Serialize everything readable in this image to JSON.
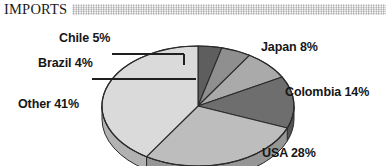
{
  "header": {
    "title": "IMPORTS",
    "decor_bar": "textured-gray-bar"
  },
  "chart_data": {
    "type": "pie",
    "title": "IMPORTS",
    "subtitle": "",
    "xlabel": "",
    "ylabel": "",
    "legend_position": "none",
    "grid": false,
    "style": "3d-pie",
    "start_angle_deg": 0,
    "direction": "clockwise",
    "categories": [
      "Brazil",
      "Chile",
      "Japan",
      "Colombia",
      "USA",
      "Other"
    ],
    "values": [
      4,
      5,
      8,
      14,
      28,
      41
    ],
    "unit": "%",
    "labels": [
      "Brazil 4%",
      "Chile 5%",
      "Japan 8%",
      "Colombia 14%",
      "USA 28%",
      "Other 41%"
    ],
    "slices": [
      {
        "name": "Brazil",
        "value": 4,
        "label": "Brazil 4%",
        "color": "#5e5e5e",
        "side_color": "#454545",
        "leader_line": true
      },
      {
        "name": "Chile",
        "value": 5,
        "label": "Chile 5%",
        "color": "#8f8f8f",
        "side_color": "#6e6e6e",
        "leader_line": true
      },
      {
        "name": "Japan",
        "value": 8,
        "label": "Japan 8%",
        "color": "#aaaaaa",
        "side_color": "#858585",
        "leader_line": false
      },
      {
        "name": "Colombia",
        "value": 14,
        "label": "Colombia 14%",
        "color": "#6e6e6e",
        "side_color": "#535353",
        "leader_line": false
      },
      {
        "name": "USA",
        "value": 28,
        "label": "USA 28%",
        "color": "#bdbdbd",
        "side_color": "#969696",
        "leader_line": false
      },
      {
        "name": "Other",
        "value": 41,
        "label": "Other 41%",
        "color": "#dadada",
        "side_color": "#b2b2b2",
        "leader_line": false
      }
    ],
    "total": 100
  },
  "colors": {
    "background": "#ffffff",
    "text": "#161616",
    "outline": "#2b2b2b",
    "leader_line": "#1f1f1f",
    "header_bar": "#cfcfcf"
  }
}
